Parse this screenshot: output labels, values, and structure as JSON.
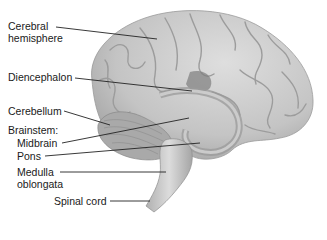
{
  "figure": {
    "labels": {
      "cerebral_hemisphere_line1": "Cerebral",
      "cerebral_hemisphere_line2": "hemisphere",
      "diencephalon": "Diencephalon",
      "cerebellum": "Cerebellum",
      "brainstem": "Brainstem:",
      "midbrain": "Midbrain",
      "pons": "Pons",
      "medulla_line1": "Medulla",
      "medulla_line2": "oblongata",
      "spinal_cord": "Spinal cord"
    },
    "colors": {
      "tissue_light": "#d4d4d4",
      "tissue_mid": "#b5b5b5",
      "tissue_dark": "#8a8a8a",
      "leader_line": "#222222"
    }
  }
}
